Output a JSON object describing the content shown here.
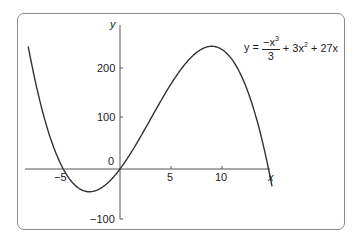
{
  "chart_data": {
    "type": "line",
    "title": "",
    "equation": "y = -x^3/3 + 3x^2 + 27x",
    "xlabel": "x",
    "ylabel": "y",
    "x_ticks": [
      -5,
      5,
      10
    ],
    "y_ticks": [
      -100,
      0,
      100,
      200
    ],
    "xlim": [
      -9.5,
      15.5
    ],
    "ylim": [
      -120,
      270
    ],
    "grid": false,
    "series": [
      {
        "name": "y = -x^3/3 + 3x^2 + 27x",
        "x_range": [
          -9,
          14.9
        ],
        "points": [
          [
            -9,
            243
          ],
          [
            -7,
            77.33
          ],
          [
            -5,
            -23.33
          ],
          [
            -3,
            -63
          ],
          [
            0,
            0
          ],
          [
            3,
            99
          ],
          [
            5,
            193.33
          ],
          [
            7,
            238.67
          ],
          [
            9,
            243
          ],
          [
            11,
            183.33
          ],
          [
            13,
            36.33
          ],
          [
            14.9,
            -71
          ]
        ]
      }
    ]
  },
  "labels": {
    "x_axis": "x",
    "y_axis": "y",
    "origin": "0",
    "x_tick_neg5": "−5",
    "x_tick_5": "5",
    "x_tick_10": "10",
    "y_tick_200": "200",
    "y_tick_100": "100",
    "y_tick_neg100": "−100",
    "eq_lhs": "y =",
    "eq_num_prefix": "−x",
    "eq_num_exp": "3",
    "eq_den": "3",
    "eq_rest_a": "+ 3x",
    "eq_rest_exp": "2",
    "eq_rest_b": "+ 27x"
  }
}
